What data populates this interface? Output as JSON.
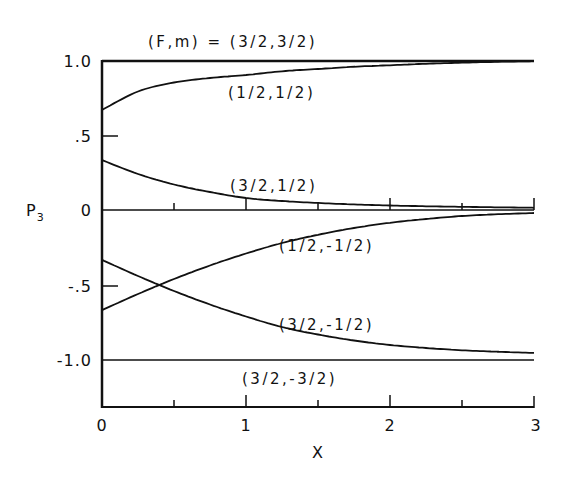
{
  "chart_data": {
    "type": "line",
    "title": "(F,m) = (3/2,3/2)",
    "xlabel": "X",
    "ylabel": "P",
    "ylabel_sub": "3",
    "xlim": [
      0,
      3
    ],
    "ylim": [
      -1.3,
      1.0
    ],
    "grid": false,
    "legend": "inline labels",
    "x_ticks": [
      {
        "value": 0,
        "label": "0"
      },
      {
        "value": 0.5,
        "label": ""
      },
      {
        "value": 1,
        "label": "1"
      },
      {
        "value": 1.5,
        "label": ""
      },
      {
        "value": 2,
        "label": "2"
      },
      {
        "value": 2.5,
        "label": ""
      },
      {
        "value": 3,
        "label": "3"
      }
    ],
    "y_ticks": [
      {
        "value": 1.0,
        "label": "1.0"
      },
      {
        "value": 0.5,
        "label": ".5"
      },
      {
        "value": 0,
        "label": "0"
      },
      {
        "value": -0.5,
        "label": "-.5"
      },
      {
        "value": -1.0,
        "label": "-1.0"
      }
    ],
    "x": [
      0,
      0.25,
      0.5,
      0.75,
      1.0,
      1.25,
      1.5,
      1.75,
      2.0,
      2.25,
      2.5,
      2.75,
      3.0
    ],
    "series": [
      {
        "name": "(3/2,3/2)",
        "label": "(F,m) = (3/2,3/2)",
        "values": [
          1.0,
          1.0,
          1.0,
          1.0,
          1.0,
          1.0,
          1.0,
          1.0,
          1.0,
          1.0,
          1.0,
          1.0,
          1.0
        ]
      },
      {
        "name": "(1/2,1/2)",
        "label": "(1/2,1/2)",
        "values": [
          0.667,
          0.79,
          0.85,
          0.88,
          0.9,
          0.925,
          0.94,
          0.955,
          0.965,
          0.975,
          0.982,
          0.988,
          0.992
        ]
      },
      {
        "name": "(3/2,1/2)",
        "label": "(3/2,1/2)",
        "values": [
          0.333,
          0.24,
          0.17,
          0.12,
          0.08,
          0.06,
          0.047,
          0.037,
          0.03,
          0.025,
          0.021,
          0.018,
          0.015
        ]
      },
      {
        "name": "(1/2,-1/2)",
        "label": "(1/2,-1/2)",
        "values": [
          -0.667,
          -0.56,
          -0.46,
          -0.37,
          -0.29,
          -0.22,
          -0.165,
          -0.12,
          -0.085,
          -0.06,
          -0.04,
          -0.028,
          -0.02
        ]
      },
      {
        "name": "(3/2,-1/2)",
        "label": "(3/2,-1/2)",
        "values": [
          -0.333,
          -0.44,
          -0.54,
          -0.63,
          -0.71,
          -0.78,
          -0.83,
          -0.87,
          -0.9,
          -0.92,
          -0.935,
          -0.945,
          -0.953
        ]
      },
      {
        "name": "(3/2,-3/2)",
        "label": "(3/2,-3/2)",
        "values": [
          -1.0,
          -1.0,
          -1.0,
          -1.0,
          -1.0,
          -1.0,
          -1.0,
          -1.0,
          -1.0,
          -1.0,
          -1.0,
          -1.0,
          -1.0
        ]
      }
    ],
    "annotations": [
      {
        "text": "(F,m) = (3/2,3/2)",
        "x": 0.47,
        "y": 1.12
      },
      {
        "text": "(1/2,1/2)",
        "x": 0.88,
        "y": 0.79
      },
      {
        "text": "(3/2,1/2)",
        "x": 0.9,
        "y": 0.16
      },
      {
        "text": "(1/2,-1/2)",
        "x": 1.22,
        "y": -0.24
      },
      {
        "text": "(3/2,-1/2)",
        "x": 1.22,
        "y": -0.79
      },
      {
        "text": "(3/2,-3/2)",
        "x": 1.0,
        "y": -1.11
      }
    ],
    "crossing": {
      "x": 0.32,
      "y": -0.5
    }
  },
  "labels": {
    "title": "(F,m) = (3/2,3/2)",
    "xlabel": "X",
    "ylabel": "P",
    "ylabel_sub": "3",
    "curve_1_2_p": "(1/2,1/2)",
    "curve_3_2_p": "(3/2,1/2)",
    "curve_1_2_m": "(1/2,-1/2)",
    "curve_3_2_m": "(3/2,-1/2)",
    "curve_3_2_mm": "(3/2,-3/2)",
    "ytick_1": "1.0",
    "ytick_05": ".5",
    "ytick_0": "0",
    "ytick_m05": "-.5",
    "ytick_m1": "-1.0",
    "xtick_0": "0",
    "xtick_1": "1",
    "xtick_2": "2",
    "xtick_3": "3"
  }
}
